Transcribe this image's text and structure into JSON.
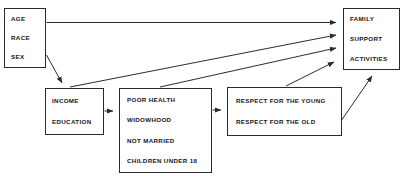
{
  "diagram": {
    "type": "flow-diagram",
    "background_color": "#ffffff",
    "line_color": "#2b2b2b",
    "text_color": "#16161a",
    "nodes": [
      {
        "id": "demographics",
        "lines": [
          "AGE",
          "RACE",
          "SEX"
        ]
      },
      {
        "id": "ses",
        "lines": [
          "INCOME",
          "EDUCATION"
        ]
      },
      {
        "id": "needs",
        "lines": [
          "POOR HEALTH",
          "WIDOWHOOD",
          "NOT MARRIED",
          "CHILDREN UNDER 18"
        ]
      },
      {
        "id": "respect",
        "lines": [
          "RESPECT FOR THE YOUNG",
          "RESPECT FOR THE OLD"
        ]
      },
      {
        "id": "outcomes",
        "lines": [
          "FAMILY",
          "SUPPORT",
          "ACTIVITIES"
        ]
      }
    ],
    "edges": [
      {
        "id": "demographics-to-outcomes",
        "from": "demographics",
        "to": "outcomes",
        "style": "horizontal-arrow"
      },
      {
        "id": "demographics-to-ses",
        "from": "demographics",
        "to": "ses",
        "style": "diagonal-arrow"
      },
      {
        "id": "ses-to-needs",
        "from": "ses",
        "to": "needs",
        "style": "horizontal-arrow"
      },
      {
        "id": "ses-to-outcomes",
        "from": "ses",
        "to": "outcomes",
        "style": "diagonal-arrow"
      },
      {
        "id": "needs-to-respect",
        "from": "needs",
        "to": "respect",
        "style": "horizontal-arrow"
      },
      {
        "id": "needs-to-outcomes",
        "from": "needs",
        "to": "outcomes",
        "style": "diagonal-arrow"
      },
      {
        "id": "respect-to-outcomes-left",
        "from": "respect",
        "to": "outcomes",
        "style": "diagonal-arrow"
      },
      {
        "id": "respect-to-outcomes-bottom",
        "from": "respect",
        "to": "outcomes",
        "style": "diagonal-arrow"
      }
    ]
  }
}
